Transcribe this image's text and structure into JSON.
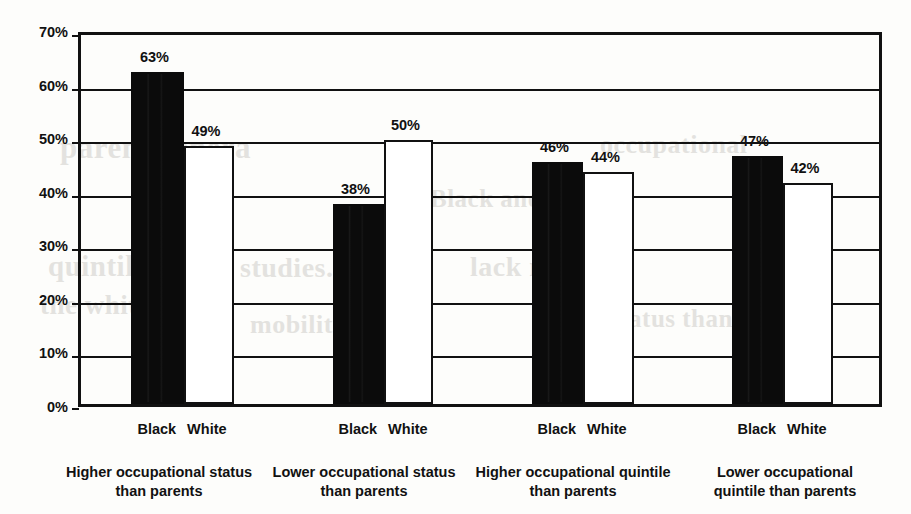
{
  "chart_data": {
    "type": "bar",
    "title": "",
    "subtitle": "",
    "xlabel": "",
    "ylabel": "",
    "ylim": [
      0,
      70
    ],
    "ytick_labels": [
      "0%",
      "10%",
      "20%",
      "30%",
      "40%",
      "50%",
      "60%",
      "70%"
    ],
    "ytick_values": [
      0,
      10,
      20,
      30,
      40,
      50,
      60,
      70
    ],
    "grid": true,
    "legend_position": "none",
    "categories": [
      "Higher occupational status than parents",
      "Lower occupational status than parents",
      "Higher occupational quintile than parents",
      "Lower occupational quintile than parents"
    ],
    "category_lines": [
      [
        "Higher occupational status",
        "than parents"
      ],
      [
        "Lower occupational status",
        "than parents"
      ],
      [
        "Higher occupational quintile",
        "than parents"
      ],
      [
        "Lower occupational",
        "quintile than parents"
      ]
    ],
    "series": [
      {
        "name": "Black",
        "values": [
          63,
          38,
          46,
          47
        ],
        "color": "#0b0b0b",
        "style": "filled"
      },
      {
        "name": "White",
        "values": [
          49,
          50,
          44,
          42
        ],
        "color": "#ffffff",
        "style": "outlined"
      }
    ],
    "data_labels": [
      [
        "63%",
        "49%"
      ],
      [
        "38%",
        "50%"
      ],
      [
        "46%",
        "44%"
      ],
      [
        "47%",
        "42%"
      ]
    ]
  },
  "axis": {
    "y_labels": [
      "70%",
      "60%",
      "50%",
      "40%",
      "30%",
      "20%",
      "10%",
      "0%"
    ]
  },
  "series_legend": {
    "black": "Black",
    "white": "White"
  },
  "ghost_text": {
    "g1": "parent genera",
    "g2": "quintiles (V,",
    "g3": "studies. The",
    "g4": "lack mobility",
    "g5": "the white an",
    "g6": "occupational",
    "g7": "mobility wit",
    "g8": "status than",
    "g9": "Black and"
  }
}
